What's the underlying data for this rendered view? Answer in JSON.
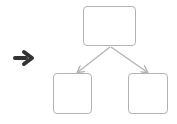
{
  "diagram": {
    "type": "tree",
    "colors": {
      "node_border": "#b4b4b4",
      "edge": "#b4b4b4",
      "pointer": "#333333",
      "background": "#ffffff"
    },
    "pointer_icon": "right-arrow-icon",
    "nodes": [
      {
        "id": "root",
        "label": "",
        "x": 83,
        "y": 6,
        "w": 53,
        "h": 40
      },
      {
        "id": "left-child",
        "label": "",
        "x": 53,
        "y": 73,
        "w": 39,
        "h": 41
      },
      {
        "id": "right-child",
        "label": "",
        "x": 128,
        "y": 73,
        "w": 40,
        "h": 41
      }
    ],
    "edges": [
      {
        "from": "root",
        "to": "left-child"
      },
      {
        "from": "root",
        "to": "right-child"
      }
    ]
  }
}
